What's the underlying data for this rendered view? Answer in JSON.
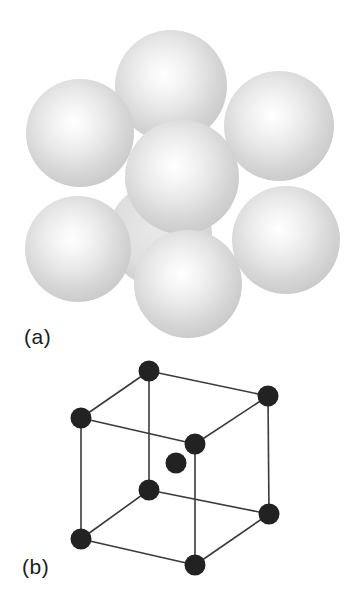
{
  "figure": {
    "background": "#ffffff",
    "panel_a": {
      "label": "(a)",
      "description": "space-filling model of body-centered cubic packing",
      "sphere_edge_color": "#bfbfbf",
      "sphere_highlight_color": "#ffffff",
      "spheres": [
        {
          "name": "sphere-top-back",
          "cx": 171,
          "cy": 86,
          "r": 56,
          "faint": false
        },
        {
          "name": "sphere-top-left",
          "cx": 80,
          "cy": 133,
          "r": 54,
          "faint": false
        },
        {
          "name": "sphere-top-right",
          "cx": 279,
          "cy": 126,
          "r": 55,
          "faint": false
        },
        {
          "name": "sphere-hidden-back",
          "cx": 160,
          "cy": 235,
          "r": 52,
          "faint": true
        },
        {
          "name": "sphere-center-front",
          "cx": 182,
          "cy": 177,
          "r": 57,
          "faint": false
        },
        {
          "name": "sphere-bottom-left",
          "cx": 78,
          "cy": 249,
          "r": 53,
          "faint": false
        },
        {
          "name": "sphere-bottom-right",
          "cx": 286,
          "cy": 240,
          "r": 54,
          "faint": false
        },
        {
          "name": "sphere-bottom-front",
          "cx": 188,
          "cy": 284,
          "r": 54,
          "faint": false
        }
      ]
    },
    "panel_b": {
      "label": "(b)",
      "description": "ball-and-stick body-centered cubic unit cell",
      "atom_color": "#222222",
      "atom_radius": 10.5,
      "edge_color": "#3a3a3a",
      "edge_width": 1.6,
      "atoms": [
        {
          "name": "corner-top-back",
          "x": 149,
          "y": 371
        },
        {
          "name": "corner-top-right",
          "x": 268,
          "y": 396
        },
        {
          "name": "corner-top-left",
          "x": 81,
          "y": 418
        },
        {
          "name": "corner-top-front",
          "x": 195,
          "y": 444
        },
        {
          "name": "corner-bottom-back",
          "x": 149,
          "y": 490
        },
        {
          "name": "corner-bottom-right",
          "x": 269,
          "y": 514
        },
        {
          "name": "corner-bottom-left",
          "x": 81,
          "y": 539
        },
        {
          "name": "corner-bottom-front",
          "x": 195,
          "y": 565
        },
        {
          "name": "body-center",
          "x": 176,
          "y": 463
        }
      ],
      "edges": [
        [
          0,
          1
        ],
        [
          0,
          2
        ],
        [
          1,
          3
        ],
        [
          2,
          3
        ],
        [
          4,
          5
        ],
        [
          4,
          6
        ],
        [
          5,
          7
        ],
        [
          6,
          7
        ],
        [
          0,
          4
        ],
        [
          1,
          5
        ],
        [
          2,
          6
        ],
        [
          3,
          7
        ]
      ]
    }
  }
}
